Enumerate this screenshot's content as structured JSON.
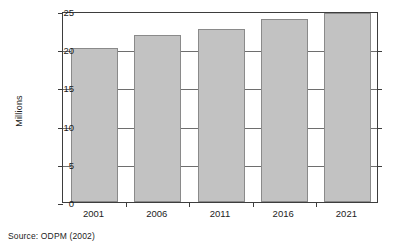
{
  "chart_data": {
    "type": "bar",
    "title": "",
    "subtitle": "",
    "xlabel": "",
    "ylabel": "Millions",
    "categories": [
      "2001",
      "2006",
      "2011",
      "2016",
      "2021"
    ],
    "values": [
      20.2,
      21.9,
      22.7,
      24.0,
      24.8
    ],
    "series": [
      {
        "name": "Households",
        "values": [
          20.2,
          21.9,
          22.7,
          24.0,
          24.8
        ]
      }
    ],
    "ylim": [
      0,
      25
    ],
    "yticks": [
      0,
      5,
      10,
      15,
      20,
      25
    ],
    "ytick_labels": [
      "0",
      "5",
      "10",
      "15",
      "20",
      "25"
    ],
    "grid": "horizontal",
    "legend": "none",
    "bar_color": "#c2c2c2",
    "bar_border_color": "#8a8a8a",
    "axis_color": "#3d3d3d",
    "gridline_color": "#6e6e6e"
  },
  "caption": {
    "source": "Source: ODPM (2002)"
  }
}
